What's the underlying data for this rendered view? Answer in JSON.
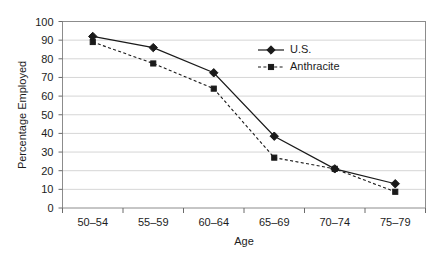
{
  "chart_data": {
    "type": "line",
    "title": "",
    "xlabel": "Age",
    "ylabel": "Percentage Employed",
    "categories": [
      "50–54",
      "55–59",
      "60–64",
      "65–69",
      "70–74",
      "75–79"
    ],
    "series": [
      {
        "name": "U.S.",
        "marker": "diamond",
        "line_style": "solid",
        "color": "#1a1a1a",
        "values": [
          92,
          86,
          72.5,
          38.5,
          21,
          13
        ]
      },
      {
        "name": "Anthracite",
        "marker": "square",
        "line_style": "dashed",
        "color": "#1a1a1a",
        "values": [
          89,
          77.5,
          64,
          27,
          21,
          8.7
        ]
      }
    ],
    "ylim": [
      0,
      100
    ],
    "y_ticks": [
      "0",
      "10",
      "20",
      "30",
      "40",
      "50",
      "60",
      "70",
      "80",
      "90",
      "100"
    ],
    "y_tick_step": 10,
    "grid": true,
    "grid_axis": "y",
    "grid_color": "#d6d6d6",
    "legend_position": "inside-top-right",
    "plot_border_color": "#888888",
    "background": "#ffffff"
  },
  "legend": {
    "entries": [
      {
        "label": "U.S."
      },
      {
        "label": "Anthracite"
      }
    ]
  },
  "axes": {
    "y_title": "Percentage Employed",
    "x_title": "Age"
  }
}
